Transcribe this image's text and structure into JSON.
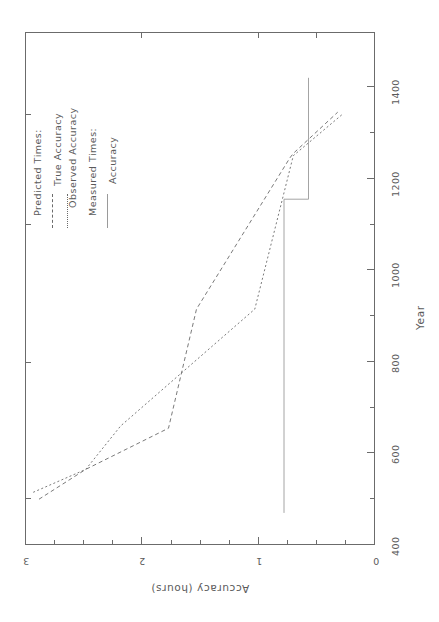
{
  "figure": {
    "orientation": "rotated-90-clockwise",
    "background": "#ffffff",
    "ink_color": "#6b6b6b"
  },
  "legend": {
    "group1_title": "Predicted Times:",
    "group1_items": [
      {
        "label": "True Accuracy",
        "style": "dashed"
      },
      {
        "label": "Observed Accuracy",
        "style": "dotted"
      }
    ],
    "group2_title": "Measured Times:",
    "group2_items": [
      {
        "label": "Accuracy",
        "style": "solid"
      }
    ]
  },
  "chart_data": {
    "type": "line",
    "title": "",
    "xlabel": "Year",
    "ylabel": "Accuracy (hours)",
    "xlim": [
      330,
      1450
    ],
    "ylim": [
      0,
      3
    ],
    "xticks": [
      400,
      600,
      800,
      1000,
      1200,
      1400
    ],
    "xtick_labels": [
      "400",
      "600",
      "800",
      "1000",
      "1200",
      "1400"
    ],
    "xminor_ticks": [
      500,
      700,
      900,
      1100,
      1300
    ],
    "yticks": [
      0,
      1,
      2,
      3
    ],
    "ytick_labels": [
      "0",
      "1",
      "2",
      "3"
    ],
    "yminor_ticks": [
      0.25,
      0.5,
      0.75,
      1.25,
      1.5,
      1.75,
      2.25,
      2.5,
      2.75
    ],
    "grid": false,
    "legend_position": "upper-left",
    "series": [
      {
        "name": "True Accuracy",
        "style": "dashed",
        "color": "#6b6b6b",
        "points": [
          [
            430,
            2.88
          ],
          [
            495,
            2.48
          ],
          [
            585,
            1.77
          ],
          [
            845,
            1.53
          ],
          [
            1175,
            0.73
          ],
          [
            1185,
            0.7
          ],
          [
            1275,
            0.32
          ]
        ]
      },
      {
        "name": "Observed Accuracy",
        "style": "dotted",
        "color": "#6b6b6b",
        "points": [
          [
            445,
            2.93
          ],
          [
            495,
            2.48
          ],
          [
            590,
            2.18
          ],
          [
            845,
            1.03
          ],
          [
            1180,
            0.7
          ],
          [
            1270,
            0.28
          ]
        ]
      },
      {
        "name": "Accuracy",
        "style": "solid",
        "color": "#9a9a9a",
        "points": [
          [
            400,
            0.78
          ],
          [
            1085,
            0.78
          ],
          [
            1085,
            0.57
          ],
          [
            1350,
            0.57
          ]
        ]
      }
    ]
  }
}
